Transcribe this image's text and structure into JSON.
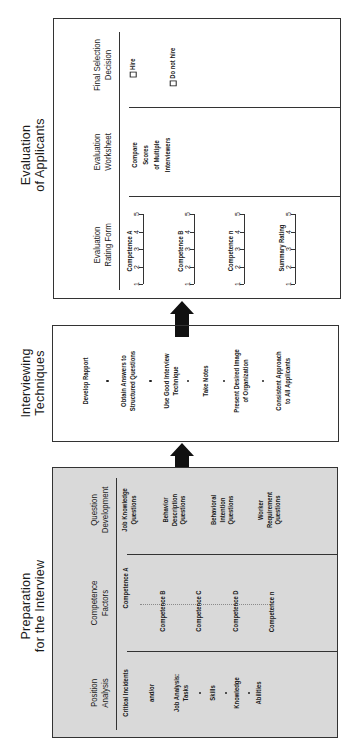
{
  "stages": [
    {
      "id": "evaluation",
      "title": "Evaluation\nof Applicants",
      "shaded": false,
      "columns": [
        {
          "header": "Evaluation\nRating Form",
          "scales": [
            {
              "label": "Competence A",
              "points": [
                "1",
                "2",
                "3",
                "4",
                "5"
              ]
            },
            {
              "label": "Competence B",
              "points": [
                "1",
                "2",
                "3",
                "4",
                "5"
              ]
            },
            {
              "label": "Competence n",
              "points": [
                "1",
                "2",
                "3",
                "4",
                "5"
              ]
            },
            {
              "label": "Summary Rating",
              "points": [
                "1",
                "2",
                "3",
                "4",
                "5"
              ]
            }
          ]
        },
        {
          "header": "Evaluation\nWorksheet",
          "items": [
            "Compare\nScores\nof Multiple\nInterviewers"
          ]
        },
        {
          "header": "Final Selection\nDecision",
          "options": [
            "Hire",
            "Do not hire"
          ]
        }
      ]
    },
    {
      "id": "interviewing",
      "title": "Interviewing\nTechniques",
      "shaded": false,
      "items": [
        "Develop Rapport",
        "Obtain Answers to\nStructured Questions",
        "Use Good Interview\nTechnique",
        "Take Notes",
        "Present Desired Image\nof Organization",
        "Consistent Approach\nto All Applicants"
      ]
    },
    {
      "id": "preparation",
      "title": "Preparation\nfor the Interview",
      "shaded": true,
      "columns": [
        {
          "header": "Position\nAnalysis",
          "items": [
            "Critical Incidents",
            "and/or",
            "Job Analysis:\nTasks",
            "Skills",
            "Knowledge",
            "Abilities"
          ]
        },
        {
          "header": "Competence\nFactors",
          "items": [
            "Competence A",
            "Competence B",
            "Competence C",
            "Competence D",
            "Competence n"
          ]
        },
        {
          "header": "Question\nDevelopment",
          "items": [
            "Job Knowledge\nQuestions",
            "Behavior\nDescription\nQuestions",
            "Behavioral\nIntention\nQuestions",
            "Worker\nRequirement\nQuestions"
          ]
        }
      ]
    }
  ],
  "arrows": [
    {
      "from": "preparation",
      "to": "interviewing",
      "direction": "up"
    },
    {
      "from": "interviewing",
      "to": "evaluation",
      "direction": "up"
    }
  ],
  "colors": {
    "line": "#333333",
    "shade": "#d9d9d9",
    "arrow": "#111111"
  }
}
